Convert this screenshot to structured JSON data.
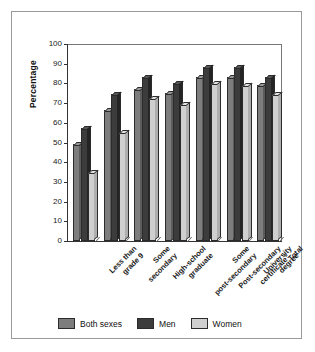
{
  "chart_data": {
    "type": "bar",
    "title": "",
    "xlabel": "",
    "ylabel": "Percentage",
    "ylim": [
      0,
      100
    ],
    "yticks": [
      0,
      10,
      20,
      30,
      40,
      50,
      60,
      70,
      80,
      90,
      100
    ],
    "grid": false,
    "legend_position": "bottom",
    "categories": [
      "Less than grade 9",
      "Some secondary",
      "High-school graduate",
      "Some post-secondary",
      "Post-secondary certificate¹",
      "University degree",
      "Total"
    ],
    "category_lines": [
      [
        "Less than",
        "grade 9"
      ],
      [
        "Some",
        "secondary"
      ],
      [
        "High-school",
        "graduate"
      ],
      [
        "Some",
        "post-secondary"
      ],
      [
        "Post-secondary",
        "certificate"
      ],
      [
        "University",
        "degree"
      ],
      [
        "Total"
      ]
    ],
    "series": [
      {
        "name": "Both sexes",
        "color": "#7d7d7d",
        "values": [
          49,
          66,
          77,
          75,
          83,
          83,
          79
        ]
      },
      {
        "name": "Men",
        "color": "#3c3c3c",
        "values": [
          57,
          74,
          83,
          80,
          88,
          88,
          83
        ]
      },
      {
        "name": "Women",
        "color": "#cfcfcf",
        "values": [
          35,
          55,
          72,
          69,
          80,
          79,
          74
        ]
      }
    ]
  },
  "axis": {
    "y_title": "Percentage",
    "tick_labels": [
      "100",
      "90",
      "80",
      "70",
      "60",
      "50",
      "40",
      "30",
      "20",
      "10",
      "0"
    ]
  },
  "legend": {
    "items": [
      {
        "label": "Both sexes",
        "swatch": "both-sexes-swatch"
      },
      {
        "label": "Men",
        "swatch": "men-swatch"
      },
      {
        "label": "Women",
        "swatch": "women-swatch"
      }
    ]
  },
  "footnote_marker": "1",
  "colors": {
    "both_sexes": "#7d7d7d",
    "men": "#3c3c3c",
    "women": "#cfcfcf",
    "frame": "#9a9a9a",
    "axis": "#333333",
    "background": "#ffffff"
  }
}
